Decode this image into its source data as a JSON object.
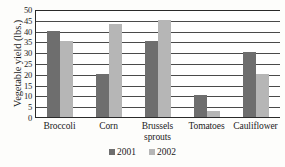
{
  "chart_data": {
    "type": "bar",
    "title": "",
    "xlabel": "",
    "ylabel": "Vegetable yield (lbs.)",
    "categories": [
      "Broccoli",
      "Corn",
      "Brussels sprouts",
      "Tomatoes",
      "Cauliflower"
    ],
    "series": [
      {
        "name": "2001",
        "color": "#6e6e6e",
        "values": [
          40,
          20,
          35,
          10,
          30
        ]
      },
      {
        "name": "2002",
        "color": "#b6b6b6",
        "values": [
          35,
          43,
          45,
          3,
          20
        ]
      }
    ],
    "ylim": [
      0,
      50
    ],
    "ytick_labels": [
      "50",
      "45",
      "40",
      "35",
      "30",
      "25",
      "20",
      "15",
      "10",
      "5",
      "0"
    ],
    "ytick_values": [
      50,
      45,
      40,
      35,
      30,
      25,
      20,
      15,
      10,
      5,
      0
    ],
    "grid": true,
    "legend_position": "bottom",
    "legend_entries": [
      "2001",
      "2002"
    ]
  }
}
